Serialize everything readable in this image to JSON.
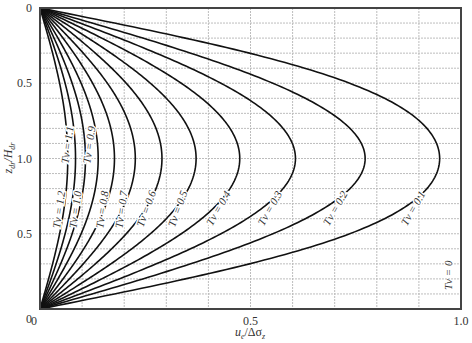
{
  "chart_data": {
    "type": "line",
    "title": "",
    "xlabel": "u_e/Δσ_z",
    "ylabel": "z_dr/H_dr",
    "xlim": [
      0,
      1.0
    ],
    "ylim_depth": [
      0,
      2.0
    ],
    "y_axis_direction": "downward (0 at top, 1.0 at mid-depth, 0 at bottom; mirrored labels)",
    "grid": true,
    "x_ticks": [
      {
        "value": 0,
        "label": "0"
      },
      {
        "value": 0.5,
        "label": "0.5"
      },
      {
        "value": 1.0,
        "label": "1.0"
      }
    ],
    "y_ticks": [
      {
        "depth": 0.0,
        "label": "0"
      },
      {
        "depth": 0.5,
        "label": "0.5"
      },
      {
        "depth": 1.0,
        "label": "1.0"
      },
      {
        "depth": 1.5,
        "label": "0.5"
      },
      {
        "depth": 2.0,
        "label": "0"
      }
    ],
    "grid_x_step": 0.1,
    "grid_y_step": 0.1,
    "series": [
      {
        "name": "Tv = 0.1",
        "Tv": 0.1,
        "peak_ue": 0.94
      },
      {
        "name": "Tv = 0.2",
        "Tv": 0.2,
        "peak_ue": 0.76
      },
      {
        "name": "Tv = 0.3",
        "Tv": 0.3,
        "peak_ue": 0.6
      },
      {
        "name": "Tv = 0.4",
        "Tv": 0.4,
        "peak_ue": 0.47
      },
      {
        "name": "Tv = 0.5",
        "Tv": 0.5,
        "peak_ue": 0.37
      },
      {
        "name": "Tv = 0.6",
        "Tv": 0.6,
        "peak_ue": 0.29
      },
      {
        "name": "Tv = 0.7",
        "Tv": 0.7,
        "peak_ue": 0.22
      },
      {
        "name": "Tv = 0.8",
        "Tv": 0.8,
        "peak_ue": 0.17
      },
      {
        "name": "Tv = 0.9",
        "Tv": 0.9,
        "peak_ue": 0.13
      },
      {
        "name": "Tv = 1.0",
        "Tv": 1.0,
        "peak_ue": 0.1
      },
      {
        "name": "Tv = 1.1",
        "Tv": 1.1,
        "peak_ue": 0.08
      },
      {
        "name": "Tv = 1.2",
        "Tv": 1.2,
        "peak_ue": 0.06
      }
    ],
    "annotations": [
      {
        "text": "Tv = 0",
        "position": "right edge, lower part (x≈1.0, depth≈1.8)"
      }
    ]
  },
  "labels": {
    "x_axis": "u",
    "x_axis_sub": "e",
    "x_axis_rest": "/Δσ",
    "x_axis_sub2": "z",
    "y_axis": "z",
    "y_axis_sub": "dr",
    "y_axis_rest": "/H",
    "y_axis_sub2": "dr",
    "tv_zero": "Tv = 0"
  },
  "colors": {
    "curve": "#111111",
    "frame": "#444444",
    "grid": "#bdbdbd",
    "text": "#333333"
  }
}
